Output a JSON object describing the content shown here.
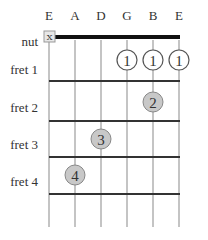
{
  "strings": [
    "E",
    "A",
    "D",
    "G",
    "B",
    "E"
  ],
  "row_labels": {
    "nut": "nut",
    "frets": [
      "fret 1",
      "fret 2",
      "fret 3",
      "fret 4"
    ]
  },
  "muted_marker": "X",
  "muted_string_index": 0,
  "open_fingers": [
    {
      "string_index": 3,
      "fret": 1,
      "label": "1",
      "style": "open-circle"
    },
    {
      "string_index": 4,
      "fret": 1,
      "label": "1",
      "style": "open-circle"
    },
    {
      "string_index": 5,
      "fret": 1,
      "label": "1",
      "style": "open-circle"
    }
  ],
  "fingers": [
    {
      "string_index": 4,
      "fret": 2,
      "label": "2"
    },
    {
      "string_index": 2,
      "fret": 3,
      "label": "3"
    },
    {
      "string_index": 1,
      "fret": 4,
      "label": "4"
    }
  ],
  "colors": {
    "finger_fill": "#c8c8c8",
    "string": "#b0b0b0",
    "fret": "#333333",
    "nut": "#111111"
  }
}
